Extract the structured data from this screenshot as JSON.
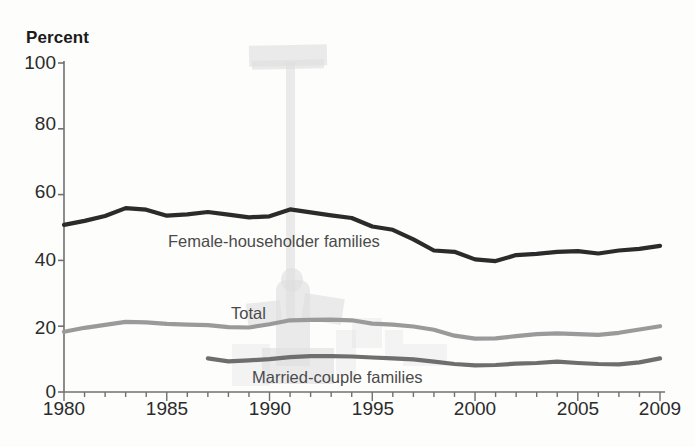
{
  "chart_data": {
    "type": "line",
    "title": "Percent",
    "xlabel": "",
    "ylabel": "Percent",
    "ylim": [
      0,
      100
    ],
    "xlim": [
      1980,
      2009
    ],
    "yticks": [
      0,
      20,
      40,
      60,
      80,
      100
    ],
    "xticks_labeled": [
      1980,
      1985,
      1990,
      1995,
      2000,
      2005,
      2009
    ],
    "xtick_interval_years": 1,
    "grid": false,
    "legend_position": "inline-annotations",
    "x": [
      1980,
      1981,
      1982,
      1983,
      1984,
      1985,
      1986,
      1987,
      1988,
      1989,
      1990,
      1991,
      1992,
      1993,
      1994,
      1995,
      1996,
      1997,
      1998,
      1999,
      2000,
      2001,
      2002,
      2003,
      2004,
      2005,
      2006,
      2007,
      2008,
      2009
    ],
    "series": [
      {
        "name": "Female-householder families",
        "color": "#2b2b2b",
        "values": [
          50.8,
          52.0,
          53.5,
          55.9,
          55.4,
          53.6,
          54.0,
          54.7,
          53.9,
          53.1,
          53.4,
          55.5,
          54.6,
          53.7,
          52.9,
          50.3,
          49.3,
          46.4,
          43.0,
          42.6,
          40.3,
          39.8,
          41.6,
          42.0,
          42.6,
          42.8,
          42.1,
          43.0,
          43.5,
          44.4
        ]
      },
      {
        "name": "Total",
        "color": "#9a9a9a",
        "values": [
          18.3,
          19.5,
          20.4,
          21.3,
          21.2,
          20.7,
          20.5,
          20.3,
          19.7,
          19.6,
          20.6,
          21.8,
          21.9,
          22.0,
          21.8,
          20.8,
          20.5,
          19.9,
          18.9,
          17.1,
          16.2,
          16.3,
          17.0,
          17.6,
          17.8,
          17.6,
          17.4,
          18.0,
          19.0,
          20.0
        ]
      },
      {
        "name": "Married-couple families",
        "color": "#6e6e6e",
        "values": [
          null,
          null,
          null,
          null,
          null,
          null,
          null,
          10.2,
          9.3,
          9.6,
          10.0,
          10.6,
          10.9,
          10.9,
          10.8,
          10.5,
          10.2,
          9.9,
          9.2,
          8.5,
          8.1,
          8.2,
          8.6,
          8.8,
          9.2,
          8.8,
          8.5,
          8.4,
          9.0,
          10.2
        ]
      }
    ],
    "annotations": [
      {
        "text": "Female-householder families",
        "series": "Female-householder families"
      },
      {
        "text": "Total",
        "series": "Total"
      },
      {
        "text": "Married-couple families",
        "series": "Married-couple families"
      }
    ]
  },
  "axis": {
    "title": "Percent",
    "y_tick_labels": [
      "100",
      "80",
      "60",
      "40",
      "20",
      "0"
    ],
    "x_tick_labels": [
      "1980",
      "1985",
      "1990",
      "1995",
      "2000",
      "2005",
      "2009"
    ]
  },
  "labels": {
    "female": "Female-householder families",
    "total": "Total",
    "married": "Married-couple families"
  },
  "colors": {
    "female": "#2b2b2b",
    "total": "#9a9a9a",
    "married": "#6e6e6e",
    "axis": "#707070",
    "text": "#2b2b2b",
    "watermark": "#dedede"
  }
}
